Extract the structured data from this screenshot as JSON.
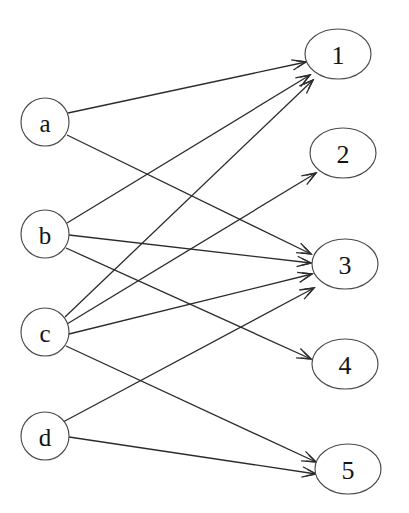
{
  "diagram": {
    "canvas": {
      "width": 409,
      "height": 513,
      "background": "#ffffff"
    },
    "stroke_color": "#2b2b2b",
    "node_stroke_color": "#4a4a4a",
    "node_fill_color": "#ffffff",
    "label_color": "#141414"
  },
  "left_nodes": [
    {
      "id": "a",
      "label": "a",
      "cx": 45,
      "cy": 122,
      "rx": 24,
      "ry": 24
    },
    {
      "id": "b",
      "label": "b",
      "cx": 45,
      "cy": 234,
      "rx": 24,
      "ry": 24
    },
    {
      "id": "c",
      "label": "c",
      "cx": 45,
      "cy": 332,
      "rx": 24,
      "ry": 24
    },
    {
      "id": "d",
      "label": "d",
      "cx": 45,
      "cy": 436,
      "rx": 24,
      "ry": 24
    }
  ],
  "right_nodes": [
    {
      "id": "1",
      "label": "1",
      "cx": 338,
      "cy": 54,
      "rx": 33,
      "ry": 25
    },
    {
      "id": "2",
      "label": "2",
      "cx": 343,
      "cy": 153,
      "rx": 33,
      "ry": 25
    },
    {
      "id": "3",
      "label": "3",
      "cx": 345,
      "cy": 264,
      "rx": 33,
      "ry": 25
    },
    {
      "id": "4",
      "label": "4",
      "cx": 345,
      "cy": 364,
      "rx": 33,
      "ry": 25
    },
    {
      "id": "5",
      "label": "5",
      "cx": 348,
      "cy": 469,
      "rx": 33,
      "ry": 25
    }
  ],
  "edges": [
    {
      "from": "a",
      "to": "1",
      "x1": 68,
      "y1": 113,
      "x2": 306,
      "y2": 62
    },
    {
      "from": "a",
      "to": "3",
      "x1": 67,
      "y1": 135,
      "x2": 311,
      "y2": 254
    },
    {
      "from": "b",
      "to": "1",
      "x1": 67,
      "y1": 223,
      "x2": 310,
      "y2": 75
    },
    {
      "from": "b",
      "to": "3",
      "x1": 69,
      "y1": 235,
      "x2": 311,
      "y2": 263
    },
    {
      "from": "b",
      "to": "4",
      "x1": 66,
      "y1": 248,
      "x2": 311,
      "y2": 359
    },
    {
      "from": "c",
      "to": "1",
      "x1": 65,
      "y1": 317,
      "x2": 313,
      "y2": 80
    },
    {
      "from": "c",
      "to": "2",
      "x1": 67,
      "y1": 324,
      "x2": 316,
      "y2": 173
    },
    {
      "from": "c",
      "to": "3",
      "x1": 69,
      "y1": 334,
      "x2": 312,
      "y2": 274
    },
    {
      "from": "c",
      "to": "5",
      "x1": 66,
      "y1": 346,
      "x2": 316,
      "y2": 462
    },
    {
      "from": "d",
      "to": "3",
      "x1": 63,
      "y1": 422,
      "x2": 314,
      "y2": 288
    },
    {
      "from": "d",
      "to": "5",
      "x1": 69,
      "y1": 437,
      "x2": 316,
      "y2": 474
    }
  ],
  "chart_data": {
    "type": "diagram",
    "subtype": "bipartite-directed-graph",
    "left_set": [
      "a",
      "b",
      "c",
      "d"
    ],
    "right_set": [
      "1",
      "2",
      "3",
      "4",
      "5"
    ],
    "adjacency": {
      "a": [
        "1",
        "3"
      ],
      "b": [
        "1",
        "3",
        "4"
      ],
      "c": [
        "1",
        "2",
        "3",
        "5"
      ],
      "d": [
        "3",
        "5"
      ]
    },
    "out_degrees": {
      "a": 2,
      "b": 3,
      "c": 4,
      "d": 2
    },
    "in_degrees": {
      "1": 3,
      "2": 1,
      "3": 4,
      "4": 1,
      "5": 2
    },
    "edge_count": 11,
    "directed": true
  }
}
